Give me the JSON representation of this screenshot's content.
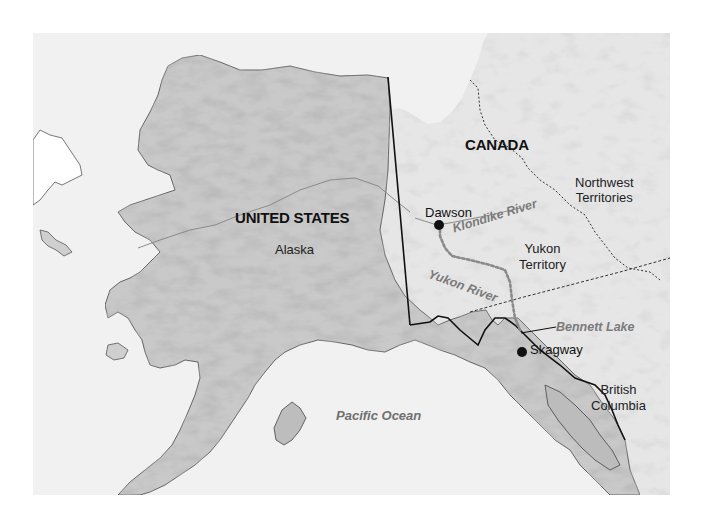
{
  "map": {
    "title": "",
    "colors": {
      "ocean": "#f1f1f1",
      "alaska_land": "#c9c9c9",
      "canada_land": "#e6e6e6",
      "coastline": "#555555",
      "intl_border": "#111111",
      "territory_border": "#333333",
      "river_route": "#888888",
      "water_label": "#707070",
      "city_dot": "#111111"
    },
    "countries": [
      {
        "id": "us",
        "label": "UNITED STATES"
      },
      {
        "id": "canada",
        "label": "CANADA"
      }
    ],
    "regions": [
      {
        "id": "alaska",
        "label": "Alaska"
      },
      {
        "id": "nwt",
        "label_line1": "Northwest",
        "label_line2": "Territories"
      },
      {
        "id": "yukon",
        "label_line1": "Yukon",
        "label_line2": "Territory"
      },
      {
        "id": "bc",
        "label_line1": "British",
        "label_line2": "Columbia"
      }
    ],
    "cities": [
      {
        "id": "dawson",
        "label": "Dawson"
      },
      {
        "id": "skagway",
        "label": "Skagway"
      }
    ],
    "water_features": [
      {
        "id": "klondike",
        "label": "Klondike River"
      },
      {
        "id": "yukon-river",
        "label": "Yukon River"
      },
      {
        "id": "bennett",
        "label": "Bennett Lake"
      },
      {
        "id": "pacific",
        "label": "Pacific Ocean"
      }
    ],
    "legend_route": "dotted line: route from Skagway to Dawson via Yukon River"
  }
}
